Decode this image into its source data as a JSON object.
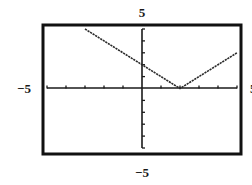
{
  "chart_data": {
    "type": "line",
    "title": "",
    "xlabel": "",
    "ylabel": "",
    "function": "y = |x - 2|",
    "xlim": [
      -5,
      5
    ],
    "ylim": [
      -5,
      5
    ],
    "xscl": 1,
    "yscl": 1,
    "grid": false,
    "legend": null,
    "window_labels": {
      "ymax": "5",
      "ymin": "−5",
      "xmin": "−5",
      "xmax": "5"
    },
    "series": [
      {
        "name": "y = |x - 2|",
        "x": [
          -3,
          -2,
          -1,
          0,
          1,
          2,
          3,
          4,
          5
        ],
        "y": [
          5,
          4,
          3,
          2,
          1,
          0,
          1,
          2,
          3
        ]
      }
    ],
    "colors": {
      "line": "#2a2a2a",
      "axes": "#1a1a1a",
      "frame": "#111111",
      "background": "#ffffff"
    }
  }
}
